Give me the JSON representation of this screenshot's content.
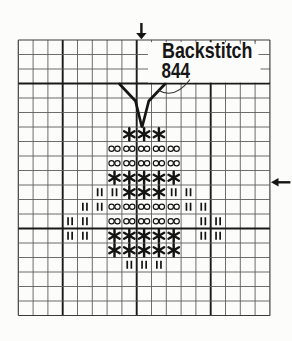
{
  "legend": {
    "label": "Backstitch",
    "code": "844"
  },
  "colors": {
    "background": "#fcfcfa",
    "grid_line": "#5c5c5c",
    "bold_line": "#1a1a1a",
    "border_line": "#3a3a3a",
    "stitch": "#141414",
    "text": "#161616"
  },
  "chart_data": {
    "type": "table",
    "columns": 17,
    "rows": 19,
    "bold_column_lines": [
      3,
      8,
      13
    ],
    "bold_row_lines": [
      3,
      13
    ],
    "center_markers": {
      "top_arrow": "down-arrow-center-column-marker",
      "right_arrow": "left-arrow-center-row-marker",
      "center_column": 8,
      "center_row": 9
    },
    "symbol_legend": {
      "star": "six-spoke-asterisk-stitch",
      "oo": "double-open-circle-stitch",
      "II": "double-bar-stitch"
    },
    "cells": [
      {
        "row": 6,
        "symbol": "star",
        "cols": [
          7,
          8,
          9
        ]
      },
      {
        "row": 7,
        "symbol": "oo",
        "cols": [
          6,
          7,
          8,
          9,
          10
        ]
      },
      {
        "row": 8,
        "symbol": "oo",
        "cols": [
          6,
          7,
          8,
          9,
          10
        ]
      },
      {
        "row": 9,
        "symbol": "star",
        "cols": [
          6,
          7,
          8,
          9,
          10
        ]
      },
      {
        "row": 10,
        "symbol": "II",
        "cols": [
          5,
          6,
          10,
          11
        ]
      },
      {
        "row": 10,
        "symbol": "star",
        "cols": [
          7,
          8,
          9
        ]
      },
      {
        "row": 11,
        "symbol": "II",
        "cols": [
          4,
          5,
          11,
          12
        ]
      },
      {
        "row": 11,
        "symbol": "oo",
        "cols": [
          6,
          7,
          8,
          9,
          10
        ]
      },
      {
        "row": 12,
        "symbol": "II",
        "cols": [
          3,
          4,
          12,
          13
        ]
      },
      {
        "row": 12,
        "symbol": "oo",
        "cols": [
          6,
          7,
          8,
          9,
          10
        ]
      },
      {
        "row": 13,
        "symbol": "II",
        "cols": [
          3,
          4,
          12,
          13
        ]
      },
      {
        "row": 13,
        "symbol": "star",
        "cols": [
          6,
          7,
          8,
          9,
          10
        ]
      },
      {
        "row": 14,
        "symbol": "star",
        "cols": [
          6,
          7,
          8,
          9,
          10
        ]
      },
      {
        "row": 15,
        "symbol": "II",
        "cols": [
          7,
          8,
          9
        ]
      }
    ],
    "backstitch_points": [
      [
        119.5,
        84
      ],
      [
        135.5,
        101
      ],
      [
        142,
        127.5
      ],
      [
        148.8,
        101
      ],
      [
        165,
        84
      ]
    ]
  }
}
